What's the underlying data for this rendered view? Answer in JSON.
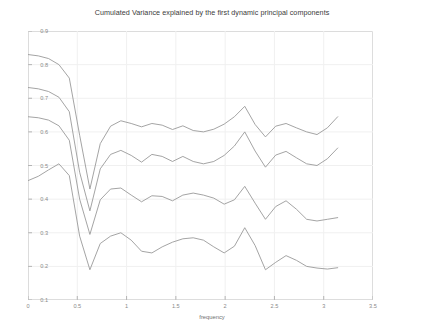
{
  "chart_data": {
    "type": "line",
    "title": "Cumulated Variance explained by the first dynamic principal components",
    "xlabel": "frequency",
    "ylabel": "",
    "xlim": [
      0,
      3.5
    ],
    "ylim": [
      0.1,
      0.9
    ],
    "grid": true,
    "legend": "none",
    "xticks": [
      "0",
      "0.5",
      "1",
      "1.5",
      "2",
      "2.5",
      "3",
      "3.5"
    ],
    "xtick_values": [
      0,
      0.5,
      1,
      1.5,
      2,
      2.5,
      3,
      3.5
    ],
    "yticks": [
      "0.1",
      "0.2",
      "0.3",
      "0.4",
      "0.5",
      "0.6",
      "0.7",
      "0.8",
      "0.9"
    ],
    "ytick_values": [
      0.1,
      0.2,
      0.3,
      0.4,
      0.5,
      0.6,
      0.7,
      0.8,
      0.9
    ],
    "line_color": "#9a9a9a",
    "x": [
      0.0,
      0.105,
      0.209,
      0.314,
      0.419,
      0.524,
      0.628,
      0.733,
      0.838,
      0.942,
      1.047,
      1.152,
      1.257,
      1.361,
      1.466,
      1.571,
      1.676,
      1.78,
      1.885,
      1.99,
      2.094,
      2.199,
      2.304,
      2.409,
      2.513,
      2.618,
      2.723,
      2.827,
      2.932,
      3.037,
      3.142
    ],
    "series": [
      {
        "name": "4 principal components",
        "values": [
          0.83,
          0.826,
          0.818,
          0.8,
          0.76,
          0.59,
          0.43,
          0.565,
          0.617,
          0.633,
          0.625,
          0.615,
          0.625,
          0.62,
          0.607,
          0.618,
          0.604,
          0.6,
          0.608,
          0.623,
          0.645,
          0.676,
          0.622,
          0.585,
          0.617,
          0.625,
          0.612,
          0.6,
          0.592,
          0.612,
          0.645
        ]
      },
      {
        "name": "3 principal components",
        "values": [
          0.732,
          0.728,
          0.72,
          0.703,
          0.66,
          0.48,
          0.365,
          0.49,
          0.533,
          0.545,
          0.53,
          0.51,
          0.533,
          0.527,
          0.512,
          0.527,
          0.512,
          0.505,
          0.512,
          0.53,
          0.558,
          0.6,
          0.543,
          0.495,
          0.531,
          0.542,
          0.523,
          0.505,
          0.5,
          0.52,
          0.552
        ]
      },
      {
        "name": "2 principal components",
        "values": [
          0.645,
          0.642,
          0.635,
          0.618,
          0.575,
          0.4,
          0.295,
          0.398,
          0.43,
          0.433,
          0.412,
          0.392,
          0.41,
          0.408,
          0.395,
          0.412,
          0.418,
          0.412,
          0.403,
          0.385,
          0.398,
          0.438,
          0.388,
          0.34,
          0.378,
          0.395,
          0.37,
          0.34,
          0.335,
          0.34,
          0.345
        ]
      },
      {
        "name": "1 principal component",
        "values": [
          0.455,
          0.468,
          0.487,
          0.505,
          0.47,
          0.29,
          0.19,
          0.268,
          0.29,
          0.3,
          0.278,
          0.245,
          0.24,
          0.258,
          0.272,
          0.282,
          0.285,
          0.278,
          0.258,
          0.24,
          0.26,
          0.315,
          0.262,
          0.19,
          0.212,
          0.232,
          0.218,
          0.2,
          0.195,
          0.192,
          0.196
        ]
      }
    ]
  }
}
